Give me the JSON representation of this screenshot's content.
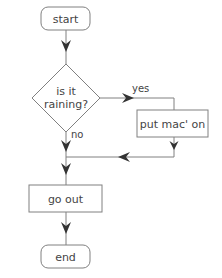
{
  "diagram": {
    "type": "flowchart",
    "colors": {
      "stroke": "#808080",
      "arrow": "#333333",
      "text": "#444444",
      "background": "#ffffff"
    },
    "nodes": {
      "start": {
        "shape": "terminator",
        "label": "start"
      },
      "decision": {
        "shape": "diamond",
        "label_line1": "is it",
        "label_line2": "raining?"
      },
      "put_mac_on": {
        "shape": "process",
        "label": "put mac' on"
      },
      "go_out": {
        "shape": "process",
        "label": "go out"
      },
      "end": {
        "shape": "terminator",
        "label": "end"
      }
    },
    "edges": {
      "yes_label": "yes",
      "no_label": "no"
    }
  }
}
